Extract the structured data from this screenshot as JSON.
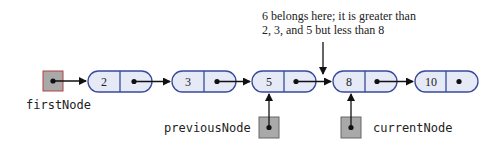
{
  "annotation": {
    "line1": "6 belongs here; it is greater than",
    "line2": "2, 3, and 5 but less than 8"
  },
  "pointers": {
    "first": "firstNode",
    "previous": "previousNode",
    "current": "currentNode"
  },
  "nodes": [
    {
      "value": "2"
    },
    {
      "value": "3"
    },
    {
      "value": "5"
    },
    {
      "value": "8"
    },
    {
      "value": "10"
    }
  ],
  "colors": {
    "node_fill": "#e6eaf7",
    "node_stroke": "#3a4a9a",
    "pointer_box_fill": "#a9a9a9",
    "pointer_box_stroke": "#666666",
    "first_box_stroke": "#b04040"
  }
}
